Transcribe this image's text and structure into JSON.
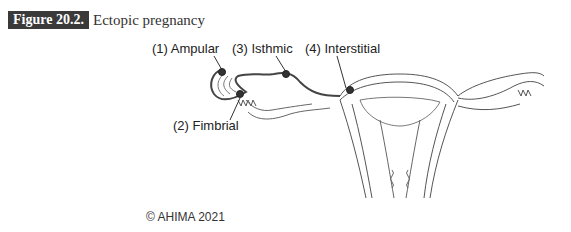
{
  "figure": {
    "label": "Figure 20.2.",
    "title": "Ectopic pregnancy"
  },
  "diagram": {
    "sites": [
      {
        "label": "(1) Ampular"
      },
      {
        "label": "(2) Fimbrial"
      },
      {
        "label": "(3) Isthmic"
      },
      {
        "label": "(4) Interstitial"
      }
    ]
  },
  "copyright": "© AHIMA 2021"
}
